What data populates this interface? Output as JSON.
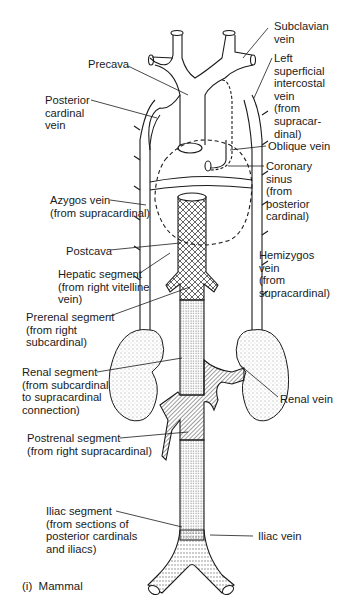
{
  "figure": {
    "caption": "(i)  Mammal",
    "labels": {
      "subclavian_vein": "Subclavian\nvein",
      "precava": "Precava",
      "left_superficial_intercostal_vein": "Left\nsuperficial\nintercostal\nvein\n(from\nsupracar-\ndinal)",
      "posterior_cardinal_vein": "Posterior\ncardinal\nvein",
      "oblique_vein": "Oblique vein",
      "coronary_sinus": "Coronary\nsinus\n(from\nposterior\ncardinal)",
      "azygos_vein": "Azygos vein\n(from supracardinal)",
      "postcava": "Postcava",
      "hemizygos_vein": "Hemizygos\nvein\n(from\nsupracardinal)",
      "hepatic_segment": "Hepatic segment\n(from right vitelline\nvein)",
      "prerenal_segment": "Prerenal segment\n(from right\nsubcardinal)",
      "renal_segment": "Renal segment\n(from subcardinal\nto supracardinal\nconnection)",
      "renal_vein": "Renal vein",
      "postrenal_segment": "Postrenal segment\n(from right supracardinal)",
      "iliac_segment": "Iliac segment\n(from sections of\nposterior cardinals\nand iliacs)",
      "iliac_vein": "Iliac vein"
    },
    "colors": {
      "ink": "#1a1a1a",
      "background": "#ffffff"
    }
  }
}
